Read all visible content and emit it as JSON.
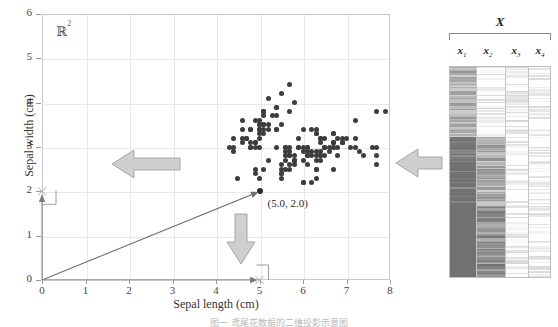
{
  "figure": {
    "space_label": "R",
    "space_label_sup": "2",
    "caption": "图一  鸢尾花数据的二维投影示意图"
  },
  "chart_data": {
    "type": "scatter",
    "title": "",
    "xlabel": "Sepal length (cm)",
    "ylabel": "Sepal width (cm)",
    "xlim": [
      0,
      8
    ],
    "ylim": [
      0,
      6
    ],
    "xticks": [
      "0",
      "1",
      "2",
      "3",
      "4",
      "5",
      "6",
      "7",
      "8"
    ],
    "yticks": [
      "0",
      "1",
      "2",
      "3",
      "4",
      "5",
      "6"
    ],
    "grid": true,
    "legend": "none",
    "annotations": [
      {
        "label": "(5.0, 2.0)",
        "x": 5.0,
        "y": 2.0,
        "marker": true
      },
      {
        "label": "R^2",
        "x": 0.35,
        "y": 5.55,
        "marker": false
      }
    ],
    "vector": {
      "from": [
        0,
        0
      ],
      "to": [
        5.0,
        2.0
      ],
      "label": "(5.0, 2.0)"
    },
    "projections": [
      {
        "axis": "x",
        "value": 5.0
      },
      {
        "axis": "y",
        "value": 2.0
      }
    ],
    "points": [
      [
        5.1,
        3.5
      ],
      [
        4.9,
        3.0
      ],
      [
        4.7,
        3.2
      ],
      [
        4.6,
        3.1
      ],
      [
        5.0,
        3.6
      ],
      [
        5.4,
        3.9
      ],
      [
        4.6,
        3.4
      ],
      [
        5.0,
        3.4
      ],
      [
        4.4,
        2.9
      ],
      [
        4.9,
        3.1
      ],
      [
        5.4,
        3.7
      ],
      [
        4.8,
        3.4
      ],
      [
        4.8,
        3.0
      ],
      [
        4.3,
        3.0
      ],
      [
        5.8,
        4.0
      ],
      [
        5.7,
        4.4
      ],
      [
        5.4,
        3.9
      ],
      [
        5.1,
        3.5
      ],
      [
        5.7,
        3.8
      ],
      [
        5.1,
        3.8
      ],
      [
        5.4,
        3.4
      ],
      [
        5.1,
        3.7
      ],
      [
        4.6,
        3.6
      ],
      [
        5.1,
        3.3
      ],
      [
        4.8,
        3.4
      ],
      [
        5.0,
        3.0
      ],
      [
        5.0,
        3.4
      ],
      [
        5.2,
        3.5
      ],
      [
        5.2,
        3.4
      ],
      [
        4.7,
        3.2
      ],
      [
        4.8,
        3.1
      ],
      [
        5.4,
        3.4
      ],
      [
        5.2,
        4.1
      ],
      [
        5.5,
        4.2
      ],
      [
        4.9,
        3.1
      ],
      [
        5.0,
        3.2
      ],
      [
        5.5,
        3.5
      ],
      [
        4.9,
        3.6
      ],
      [
        4.4,
        3.0
      ],
      [
        5.1,
        3.4
      ],
      [
        5.0,
        3.5
      ],
      [
        4.5,
        2.3
      ],
      [
        4.4,
        3.2
      ],
      [
        5.0,
        3.5
      ],
      [
        5.1,
        3.8
      ],
      [
        4.8,
        3.0
      ],
      [
        5.1,
        3.8
      ],
      [
        4.6,
        3.2
      ],
      [
        5.3,
        3.7
      ],
      [
        5.0,
        3.3
      ],
      [
        7.0,
        3.2
      ],
      [
        6.4,
        3.2
      ],
      [
        6.9,
        3.1
      ],
      [
        5.5,
        2.3
      ],
      [
        6.5,
        2.8
      ],
      [
        5.7,
        2.8
      ],
      [
        6.3,
        3.3
      ],
      [
        4.9,
        2.4
      ],
      [
        6.6,
        2.9
      ],
      [
        5.2,
        2.7
      ],
      [
        5.0,
        2.0
      ],
      [
        5.9,
        3.0
      ],
      [
        6.0,
        2.2
      ],
      [
        6.1,
        2.9
      ],
      [
        5.6,
        2.9
      ],
      [
        6.7,
        3.1
      ],
      [
        5.6,
        3.0
      ],
      [
        5.8,
        2.7
      ],
      [
        6.2,
        2.2
      ],
      [
        5.6,
        2.5
      ],
      [
        5.9,
        3.2
      ],
      [
        6.1,
        2.8
      ],
      [
        6.3,
        2.5
      ],
      [
        6.1,
        2.8
      ],
      [
        6.4,
        2.9
      ],
      [
        6.6,
        3.0
      ],
      [
        6.8,
        2.8
      ],
      [
        6.7,
        3.0
      ],
      [
        6.0,
        2.9
      ],
      [
        5.7,
        2.6
      ],
      [
        5.5,
        2.4
      ],
      [
        5.5,
        2.4
      ],
      [
        5.8,
        2.7
      ],
      [
        6.0,
        2.7
      ],
      [
        5.4,
        3.0
      ],
      [
        6.0,
        3.4
      ],
      [
        6.7,
        3.1
      ],
      [
        6.3,
        2.3
      ],
      [
        5.6,
        3.0
      ],
      [
        5.5,
        2.5
      ],
      [
        5.5,
        2.6
      ],
      [
        6.1,
        3.0
      ],
      [
        5.8,
        2.6
      ],
      [
        5.0,
        2.3
      ],
      [
        5.6,
        2.7
      ],
      [
        5.7,
        3.0
      ],
      [
        5.7,
        2.9
      ],
      [
        6.2,
        2.9
      ],
      [
        5.1,
        2.5
      ],
      [
        5.7,
        2.8
      ],
      [
        6.3,
        3.3
      ],
      [
        5.8,
        2.7
      ],
      [
        7.1,
        3.0
      ],
      [
        6.3,
        2.9
      ],
      [
        6.5,
        3.0
      ],
      [
        7.6,
        3.0
      ],
      [
        4.9,
        2.5
      ],
      [
        7.3,
        2.9
      ],
      [
        6.7,
        2.5
      ],
      [
        7.2,
        3.6
      ],
      [
        6.5,
        3.2
      ],
      [
        6.4,
        2.7
      ],
      [
        6.8,
        3.0
      ],
      [
        5.7,
        2.5
      ],
      [
        5.8,
        2.8
      ],
      [
        6.4,
        3.2
      ],
      [
        6.5,
        3.0
      ],
      [
        7.7,
        3.8
      ],
      [
        7.7,
        2.6
      ],
      [
        6.0,
        2.2
      ],
      [
        6.9,
        3.2
      ],
      [
        5.6,
        2.8
      ],
      [
        7.7,
        2.8
      ],
      [
        6.3,
        2.7
      ],
      [
        6.7,
        3.3
      ],
      [
        7.2,
        3.2
      ],
      [
        6.2,
        2.8
      ],
      [
        6.1,
        3.0
      ],
      [
        6.4,
        2.8
      ],
      [
        7.2,
        3.0
      ],
      [
        7.4,
        2.8
      ],
      [
        7.9,
        3.8
      ],
      [
        6.4,
        2.8
      ],
      [
        6.3,
        2.8
      ],
      [
        6.1,
        2.6
      ],
      [
        7.7,
        3.0
      ],
      [
        6.3,
        3.4
      ],
      [
        6.4,
        3.1
      ],
      [
        6.0,
        3.0
      ],
      [
        6.9,
        3.1
      ],
      [
        6.7,
        3.1
      ],
      [
        6.9,
        3.1
      ],
      [
        5.8,
        2.7
      ],
      [
        6.8,
        3.2
      ],
      [
        6.7,
        3.3
      ],
      [
        6.7,
        3.0
      ],
      [
        6.3,
        2.5
      ],
      [
        6.5,
        3.0
      ],
      [
        6.2,
        3.4
      ],
      [
        5.9,
        3.0
      ]
    ]
  },
  "matrix": {
    "title": "X",
    "columns": [
      {
        "label": "x",
        "sub": "1"
      },
      {
        "label": "x",
        "sub": "2"
      },
      {
        "label": "x",
        "sub": "3"
      },
      {
        "label": "x",
        "sub": "4"
      }
    ],
    "row_count": 150,
    "description": "grayscale-heatmap"
  },
  "arrows": [
    {
      "name": "arrow-scatter-to-yaxis",
      "direction": "left",
      "color": "#b0b0b0"
    },
    {
      "name": "arrow-scatter-to-xaxis",
      "direction": "down",
      "color": "#b0b0b0"
    },
    {
      "name": "arrow-matrix-to-scatter",
      "direction": "left",
      "color": "#b0b0b0"
    }
  ],
  "colors": {
    "dot": "#3d3d3d",
    "grid": "#e8e8e8",
    "frame": "#c9c9c9",
    "arrow_fill": "#cfcfcf",
    "arrow_stroke": "#9a9a9a",
    "vector": "#6f6f6f"
  }
}
